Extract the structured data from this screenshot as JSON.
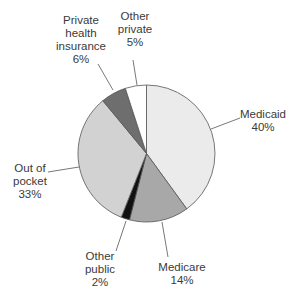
{
  "chart_data": {
    "type": "pie",
    "title": "",
    "start_angle_deg": 0,
    "direction": "clockwise",
    "slices": [
      {
        "label": "Medicaid",
        "value": 40,
        "value_label": "40%",
        "color": "#ebebeb"
      },
      {
        "label": "Medicare",
        "value": 14,
        "value_label": "14%",
        "color": "#a8a8a8"
      },
      {
        "label": "Other public",
        "value": 2,
        "value_label": "2%",
        "color": "#111111"
      },
      {
        "label": "Out of pocket",
        "value": 33,
        "value_label": "33%",
        "color": "#d2d2d2"
      },
      {
        "label": "Private health insurance",
        "value": 6,
        "value_label": "6%",
        "color": "#6e6e6e"
      },
      {
        "label": "Other private",
        "value": 5,
        "value_label": "5%",
        "color": "#ffffff"
      }
    ],
    "legend": "none (direct labels with leader lines)"
  },
  "labels": {
    "medicaid": {
      "line1": "Medicaid",
      "value": "40%"
    },
    "medicare": {
      "line1": "Medicare",
      "value": "14%"
    },
    "other_public": {
      "line1": "Other",
      "line2": "public",
      "value": "2%"
    },
    "out_of_pocket": {
      "line1": "Out of",
      "line2": "pocket",
      "value": "33%"
    },
    "private_health": {
      "line1": "Private",
      "line2": "health",
      "line3": "insurance",
      "value": "6%"
    },
    "other_private": {
      "line1": "Other",
      "line2": "private",
      "value": "5%"
    }
  }
}
